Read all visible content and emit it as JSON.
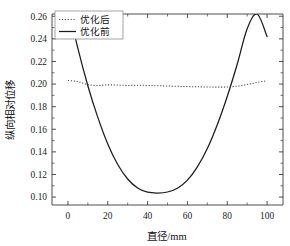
{
  "chart_data": {
    "type": "line",
    "title": "",
    "xlabel": "直径/mm",
    "ylabel": "纵向相对位移",
    "xlim": [
      -8,
      108
    ],
    "ylim": [
      0.093,
      0.262
    ],
    "xticks": [
      0,
      20,
      40,
      60,
      80,
      100
    ],
    "xticklabels": [
      "0",
      "20",
      "40",
      "60",
      "80",
      "100"
    ],
    "xminorticks": [
      10,
      30,
      50,
      70,
      90
    ],
    "yticks": [
      0.1,
      0.12,
      0.14,
      0.16,
      0.18,
      0.2,
      0.22,
      0.24,
      0.26
    ],
    "yticklabels": [
      "0.10",
      "0.12",
      "0.14",
      "0.16",
      "0.18",
      "0.20",
      "0.22",
      "0.24",
      "0.26"
    ],
    "grid": false,
    "legend_position": "upper-left",
    "series": [
      {
        "name": "优化后",
        "style": "dotted",
        "color": "#4a4a4a",
        "x": [
          0,
          5,
          10,
          15,
          20,
          25,
          30,
          35,
          40,
          45,
          50,
          55,
          60,
          65,
          70,
          75,
          80,
          85,
          90,
          95,
          100
        ],
        "values": [
          0.2032,
          0.2022,
          0.1995,
          0.1988,
          0.1993,
          0.1991,
          0.1988,
          0.199,
          0.1988,
          0.1985,
          0.1983,
          0.198,
          0.1978,
          0.1976,
          0.1974,
          0.1973,
          0.1974,
          0.1982,
          0.1996,
          0.2014,
          0.203
        ]
      },
      {
        "name": "优化前",
        "style": "solid",
        "color": "#1b1b1b",
        "x": [
          0,
          5,
          10,
          15,
          20,
          25,
          30,
          35,
          40,
          45,
          50,
          55,
          60,
          65,
          70,
          75,
          80,
          85,
          90,
          95,
          100
        ],
        "values": [
          0.27,
          0.2315,
          0.1985,
          0.1705,
          0.147,
          0.1288,
          0.116,
          0.108,
          0.1043,
          0.1036,
          0.1045,
          0.1078,
          0.115,
          0.1268,
          0.143,
          0.164,
          0.189,
          0.2175,
          0.249,
          0.262,
          0.242
        ]
      }
    ]
  },
  "legend": {
    "entries": [
      {
        "label": "优化后",
        "style": "dotted"
      },
      {
        "label": "优化前",
        "style": "solid"
      }
    ]
  }
}
